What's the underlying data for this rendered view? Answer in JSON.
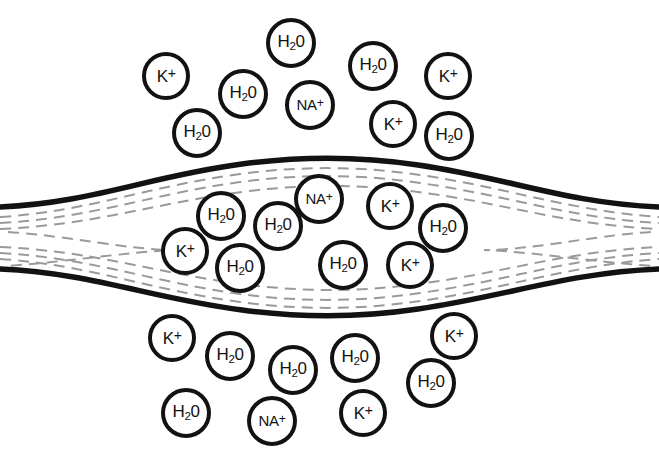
{
  "figure": {
    "name": "cell-membrane-osmosis-diagram",
    "background_color": "#ffffff",
    "stroke_color": "#121212",
    "dash_color": "#9a9a9a",
    "width": 659,
    "height": 464
  },
  "species": {
    "potassium": {
      "key": "K",
      "text": "K+",
      "main": "K",
      "charge": "+"
    },
    "sodium": {
      "key": "NA",
      "text": "NA+",
      "main": "NA",
      "charge": "+"
    },
    "water": {
      "key": "H2O",
      "text": "H20",
      "main": "H",
      "sub": "2",
      "tail": "0"
    }
  },
  "membrane": {
    "name": "lens-shaped-membrane",
    "description": "swollen tubular membrane with tapered left and right ends",
    "outer_line_color": "#121212",
    "inner_dashed_color": "#9a9a9a",
    "left_tip_x": 0,
    "right_tip_x": 659,
    "apex_top_y": 160,
    "apex_bottom_y": 311
  },
  "particles": {
    "outside_top": [
      {
        "label": "K+",
        "species": "potassium",
        "x": 142,
        "y": 52,
        "d": 48,
        "font": 17
      },
      {
        "label": "H20",
        "species": "water",
        "x": 266,
        "y": 18,
        "d": 50,
        "font": 17
      },
      {
        "label": "H20",
        "species": "water",
        "x": 348,
        "y": 41,
        "d": 50,
        "font": 17
      },
      {
        "label": "K+",
        "species": "potassium",
        "x": 424,
        "y": 52,
        "d": 48,
        "font": 17
      },
      {
        "label": "H20",
        "species": "water",
        "x": 218,
        "y": 69,
        "d": 50,
        "font": 17
      },
      {
        "label": "NA+",
        "species": "sodium",
        "x": 285,
        "y": 80,
        "d": 50,
        "font": 15
      },
      {
        "label": "K+",
        "species": "potassium",
        "x": 369,
        "y": 100,
        "d": 48,
        "font": 17
      },
      {
        "label": "H20",
        "species": "water",
        "x": 172,
        "y": 108,
        "d": 50,
        "font": 17
      },
      {
        "label": "H20",
        "species": "water",
        "x": 424,
        "y": 111,
        "d": 50,
        "font": 17
      }
    ],
    "inside": [
      {
        "label": "NA+",
        "species": "sodium",
        "x": 294,
        "y": 174,
        "d": 50,
        "font": 15
      },
      {
        "label": "K+",
        "species": "potassium",
        "x": 366,
        "y": 182,
        "d": 48,
        "font": 17
      },
      {
        "label": "H20",
        "species": "water",
        "x": 196,
        "y": 191,
        "d": 50,
        "font": 17
      },
      {
        "label": "H20",
        "species": "water",
        "x": 253,
        "y": 201,
        "d": 50,
        "font": 17
      },
      {
        "label": "H20",
        "species": "water",
        "x": 418,
        "y": 203,
        "d": 50,
        "font": 17
      },
      {
        "label": "K+",
        "species": "potassium",
        "x": 161,
        "y": 227,
        "d": 48,
        "font": 17
      },
      {
        "label": "H20",
        "species": "water",
        "x": 215,
        "y": 243,
        "d": 50,
        "font": 17
      },
      {
        "label": "H20",
        "species": "water",
        "x": 318,
        "y": 240,
        "d": 50,
        "font": 17
      },
      {
        "label": "K+",
        "species": "potassium",
        "x": 386,
        "y": 241,
        "d": 48,
        "font": 17
      }
    ],
    "outside_bottom": [
      {
        "label": "K+",
        "species": "potassium",
        "x": 148,
        "y": 314,
        "d": 48,
        "font": 17
      },
      {
        "label": "K+",
        "species": "potassium",
        "x": 430,
        "y": 312,
        "d": 48,
        "font": 17
      },
      {
        "label": "H20",
        "species": "water",
        "x": 205,
        "y": 331,
        "d": 50,
        "font": 17
      },
      {
        "label": "H20",
        "species": "water",
        "x": 330,
        "y": 333,
        "d": 50,
        "font": 17
      },
      {
        "label": "H20",
        "species": "water",
        "x": 268,
        "y": 345,
        "d": 50,
        "font": 17
      },
      {
        "label": "H20",
        "species": "water",
        "x": 406,
        "y": 358,
        "d": 50,
        "font": 17
      },
      {
        "label": "H20",
        "species": "water",
        "x": 161,
        "y": 388,
        "d": 50,
        "font": 17
      },
      {
        "label": "NA+",
        "species": "sodium",
        "x": 247,
        "y": 396,
        "d": 50,
        "font": 15
      },
      {
        "label": "K+",
        "species": "potassium",
        "x": 339,
        "y": 389,
        "d": 48,
        "font": 17
      }
    ]
  }
}
